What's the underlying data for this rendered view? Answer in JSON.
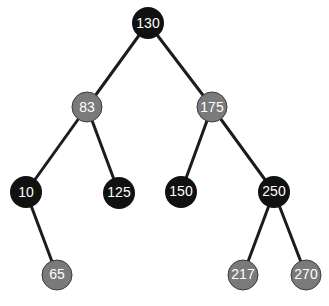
{
  "diagram": {
    "type": "red-black-tree",
    "colors": {
      "black": "#111111",
      "gray": "#7a7a7a",
      "edge": "#1c1c1c",
      "label": "#ffffff"
    },
    "nodes": [
      {
        "id": "n130",
        "label": "130",
        "color": "black",
        "x": 148,
        "y": 23
      },
      {
        "id": "n83",
        "label": "83",
        "color": "gray",
        "x": 87,
        "y": 107
      },
      {
        "id": "n175",
        "label": "175",
        "color": "gray",
        "x": 212,
        "y": 107
      },
      {
        "id": "n10",
        "label": "10",
        "color": "black",
        "x": 26,
        "y": 192
      },
      {
        "id": "n125",
        "label": "125",
        "color": "black",
        "x": 119,
        "y": 193
      },
      {
        "id": "n150",
        "label": "150",
        "color": "black",
        "x": 181,
        "y": 192
      },
      {
        "id": "n250",
        "label": "250",
        "color": "black",
        "x": 274,
        "y": 192
      },
      {
        "id": "n65",
        "label": "65",
        "color": "gray",
        "x": 57,
        "y": 275
      },
      {
        "id": "n217",
        "label": "217",
        "color": "gray",
        "x": 243,
        "y": 275
      },
      {
        "id": "n270",
        "label": "270",
        "color": "gray",
        "x": 306,
        "y": 275
      }
    ],
    "edges": [
      [
        "n130",
        "n83"
      ],
      [
        "n130",
        "n175"
      ],
      [
        "n83",
        "n10"
      ],
      [
        "n83",
        "n125"
      ],
      [
        "n175",
        "n150"
      ],
      [
        "n175",
        "n250"
      ],
      [
        "n10",
        "n65"
      ],
      [
        "n250",
        "n217"
      ],
      [
        "n250",
        "n270"
      ]
    ]
  }
}
